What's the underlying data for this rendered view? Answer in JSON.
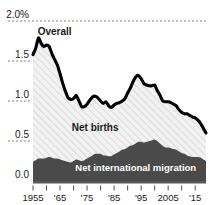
{
  "chart_data": {
    "type": "area",
    "title": "",
    "subtitle": "",
    "xlabel": "",
    "ylabel": "",
    "unit": "%",
    "grid": true,
    "legend_position": "inline-annotations",
    "xlim": [
      1955,
      2019
    ],
    "ylim": [
      0.0,
      2.0
    ],
    "ytick_labels": [
      "2.0%",
      "1.5",
      "1.0",
      "0.5",
      "0.0"
    ],
    "ytick_values": [
      2.0,
      1.5,
      1.0,
      0.5,
      0.0
    ],
    "xtick_labels": [
      "1955",
      "'65",
      "'75",
      "'85",
      "'95",
      "2005",
      "'15"
    ],
    "xtick_values": [
      1955,
      1965,
      1975,
      1985,
      1995,
      2005,
      2015
    ],
    "minor_xtick_values": [
      1955,
      1960,
      1965,
      1970,
      1975,
      1980,
      1985,
      1990,
      1995,
      2000,
      2005,
      2010,
      2015
    ],
    "annotations": [
      {
        "text": "Overall",
        "series": "overall",
        "x": 1963,
        "y": 1.82,
        "style": "dark-bold"
      },
      {
        "text": "Net births",
        "series": "net_births",
        "x": 1978,
        "y": 0.62,
        "style": "dark-bold"
      },
      {
        "text": "Net international migration",
        "series": "net_migration",
        "x": 1993,
        "y": 0.13,
        "style": "light-bold"
      }
    ],
    "x": [
      1955,
      1956,
      1957,
      1958,
      1959,
      1960,
      1961,
      1962,
      1963,
      1964,
      1965,
      1966,
      1967,
      1968,
      1969,
      1970,
      1971,
      1972,
      1973,
      1974,
      1975,
      1976,
      1977,
      1978,
      1979,
      1980,
      1981,
      1982,
      1983,
      1984,
      1985,
      1986,
      1987,
      1988,
      1989,
      1990,
      1991,
      1992,
      1993,
      1994,
      1995,
      1996,
      1997,
      1998,
      1999,
      2000,
      2001,
      2002,
      2003,
      2004,
      2005,
      2006,
      2007,
      2008,
      2009,
      2010,
      2011,
      2012,
      2013,
      2014,
      2015,
      2016,
      2017,
      2018,
      2019
    ],
    "series": [
      {
        "name": "Overall",
        "key": "overall",
        "kind": "line",
        "color": "#000000",
        "values": [
          1.58,
          1.66,
          1.79,
          1.72,
          1.68,
          1.7,
          1.68,
          1.59,
          1.52,
          1.45,
          1.34,
          1.22,
          1.12,
          1.04,
          1.02,
          1.03,
          1.07,
          1.0,
          0.93,
          0.93,
          0.96,
          1.01,
          1.05,
          1.06,
          1.04,
          1.0,
          0.97,
          0.99,
          0.94,
          0.92,
          0.95,
          0.97,
          0.98,
          1.0,
          1.03,
          1.1,
          1.16,
          1.24,
          1.3,
          1.32,
          1.28,
          1.22,
          1.2,
          1.19,
          1.19,
          1.2,
          1.13,
          1.07,
          1.0,
          0.99,
          0.99,
          0.98,
          0.96,
          0.94,
          0.89,
          0.86,
          0.84,
          0.84,
          0.82,
          0.8,
          0.79,
          0.76,
          0.72,
          0.66,
          0.6
        ]
      },
      {
        "name": "Net births",
        "key": "net_births",
        "kind": "area-band",
        "color": "#f0f0f0",
        "pattern": "diagonal-hatch",
        "values": [
          1.34,
          1.4,
          1.51,
          1.44,
          1.4,
          1.41,
          1.38,
          1.3,
          1.24,
          1.17,
          1.07,
          0.96,
          0.87,
          0.8,
          0.79,
          0.78,
          0.8,
          0.74,
          0.68,
          0.67,
          0.68,
          0.71,
          0.73,
          0.72,
          0.7,
          0.66,
          0.65,
          0.67,
          0.63,
          0.61,
          0.62,
          0.62,
          0.61,
          0.61,
          0.63,
          0.68,
          0.72,
          0.79,
          0.83,
          0.83,
          0.79,
          0.74,
          0.71,
          0.69,
          0.68,
          0.68,
          0.63,
          0.6,
          0.56,
          0.57,
          0.57,
          0.57,
          0.56,
          0.55,
          0.52,
          0.51,
          0.5,
          0.52,
          0.51,
          0.5,
          0.49,
          0.46,
          0.43,
          0.39,
          0.35
        ]
      },
      {
        "name": "Net international migration",
        "key": "net_migration",
        "kind": "area",
        "color": "#4a4a4a",
        "values": [
          0.24,
          0.26,
          0.28,
          0.28,
          0.28,
          0.29,
          0.3,
          0.29,
          0.28,
          0.28,
          0.27,
          0.26,
          0.25,
          0.24,
          0.23,
          0.25,
          0.27,
          0.26,
          0.25,
          0.26,
          0.28,
          0.3,
          0.32,
          0.34,
          0.34,
          0.34,
          0.32,
          0.32,
          0.31,
          0.31,
          0.33,
          0.35,
          0.37,
          0.39,
          0.4,
          0.42,
          0.44,
          0.45,
          0.47,
          0.49,
          0.49,
          0.48,
          0.49,
          0.5,
          0.51,
          0.52,
          0.5,
          0.47,
          0.44,
          0.42,
          0.42,
          0.41,
          0.4,
          0.39,
          0.37,
          0.35,
          0.34,
          0.32,
          0.31,
          0.3,
          0.3,
          0.3,
          0.29,
          0.27,
          0.25
        ]
      }
    ]
  }
}
